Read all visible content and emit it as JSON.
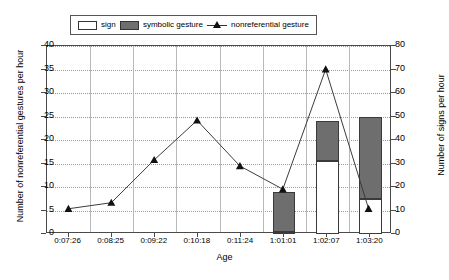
{
  "legend": {
    "entries": [
      {
        "label": "sign",
        "marker": "open-bar-swatch"
      },
      {
        "label": "symbolic gesture",
        "marker": "filled-bar-swatch"
      },
      {
        "label": "nonreferential gesture",
        "marker": "line-triangle-swatch"
      }
    ]
  },
  "axes": {
    "x_title": "Age",
    "y_left_title": "Number of nonreferential gestures per hour",
    "y_right_title": "Number of signs per hour",
    "y_left_ticks": [
      "0",
      "5",
      "10",
      "15",
      "20",
      "25",
      "30",
      "35",
      "40"
    ],
    "y_right_ticks": [
      "0",
      "10",
      "20",
      "30",
      "40",
      "50",
      "60",
      "70",
      "80"
    ]
  },
  "colors": {
    "sign_bar": "#ffffff",
    "symbolic_bar": "#6e6e6e",
    "line": "#3a3a3a",
    "marker": "#111111",
    "frame": "#4a4a4a",
    "gridline": "#9a9a9a"
  },
  "chart_data": {
    "type": "bar",
    "title": "",
    "xlabel": "Age",
    "ylabel": "Number of nonreferential gestures per hour",
    "y2label": "Number of signs per hour",
    "ylim": [
      0,
      40
    ],
    "y2lim": [
      0,
      80
    ],
    "grid": true,
    "legend_position": "top",
    "stacked": true,
    "categories": [
      "0:07:26",
      "0:08:25",
      "0:09:22",
      "0:10:18",
      "0:11:24",
      "1:01:01",
      "1:02:07",
      "1:03:20"
    ],
    "series": [
      {
        "name": "sign",
        "type": "bar",
        "axis": "right",
        "units": "signs per hour",
        "values": [
          0,
          0,
          0,
          0,
          0,
          1,
          31,
          15
        ]
      },
      {
        "name": "symbolic gesture",
        "type": "bar",
        "axis": "right",
        "units": "signs per hour",
        "stacked_on": "sign",
        "values": [
          0,
          0,
          0,
          0,
          0,
          17,
          17,
          35
        ],
        "cumulative_tops": [
          0,
          0,
          0,
          0,
          0,
          18,
          48,
          50
        ]
      },
      {
        "name": "nonreferential gesture",
        "type": "line",
        "axis": "left",
        "units": "nonreferential gestures per hour",
        "marker": "triangle",
        "values": [
          5,
          6.3,
          15.5,
          24,
          14.2,
          9.2,
          35,
          5
        ]
      }
    ]
  }
}
